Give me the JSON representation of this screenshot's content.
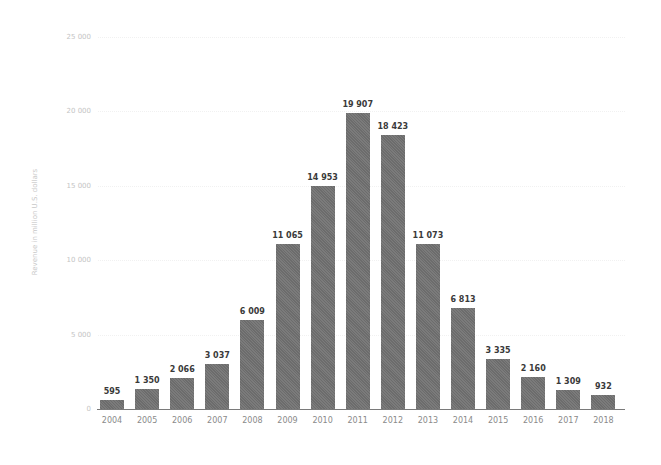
{
  "chart_data": {
    "type": "bar",
    "title": "",
    "xlabel": "",
    "ylabel": "Revenue in million U.S. dollars",
    "ylim": [
      0,
      25000
    ],
    "yticks": [
      0,
      5000,
      10000,
      15000,
      20000,
      25000
    ],
    "ytick_labels": [
      "0",
      "5 000",
      "10 000",
      "15 000",
      "20 000",
      "25 000"
    ],
    "grid": true,
    "legend": null,
    "categories": [
      "2004",
      "2005",
      "2006",
      "2007",
      "2008",
      "2009",
      "2010",
      "2011",
      "2012",
      "2013",
      "2014",
      "2015",
      "2016",
      "2017",
      "2018"
    ],
    "values": [
      595,
      1350,
      2066,
      3037,
      6009,
      11065,
      14953,
      19907,
      18423,
      11073,
      6813,
      3335,
      2160,
      1309,
      932
    ],
    "value_labels": [
      "595",
      "1 350",
      "2 066",
      "3 037",
      "6 009",
      "11 065",
      "14 953",
      "19 907",
      "18 423",
      "11 073",
      "6 813",
      "3 335",
      "2 160",
      "1 309",
      "932"
    ],
    "bar_color": "#6c6c6c"
  }
}
